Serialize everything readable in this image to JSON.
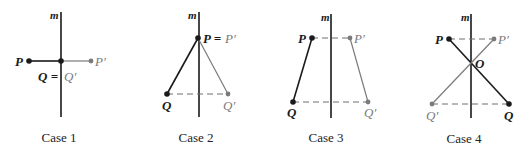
{
  "colors": {
    "original": "#1a1a1a",
    "image": "#7a7a7a",
    "axis": "#1a1a1a",
    "dashed": "#6e6e6e"
  },
  "axis_label": "m",
  "cases": [
    {
      "id": "case-1",
      "caption": "Case 1",
      "caption_pos": [
        59,
        142
      ],
      "axis": {
        "x": 61,
        "y1": 12,
        "y2": 117,
        "label_pos": [
          50,
          19
        ]
      },
      "points": [
        {
          "name": "P",
          "x": 29,
          "y": 61,
          "kind": "original",
          "label": "P",
          "label_pos": [
            15,
            66
          ]
        },
        {
          "name": "Q",
          "x": 61,
          "y": 61,
          "kind": "original",
          "label": "",
          "label_pos": [
            0,
            0
          ]
        },
        {
          "name": "P'",
          "x": 91,
          "y": 61,
          "kind": "image",
          "label": "P′",
          "label_pos": [
            95,
            66
          ]
        }
      ],
      "solid_segments": [
        {
          "from": [
            29,
            61
          ],
          "to": [
            61,
            61
          ],
          "kind": "original"
        },
        {
          "from": [
            61,
            61
          ],
          "to": [
            91,
            61
          ],
          "kind": "image"
        }
      ],
      "dashed_segments": [],
      "extra_labels": [
        {
          "text": "Q =",
          "pos": [
            38,
            81
          ],
          "kind": "original"
        },
        {
          "text": "Q′",
          "pos": [
            64,
            81
          ],
          "kind": "image"
        }
      ]
    },
    {
      "id": "case-2",
      "caption": "Case 2",
      "caption_pos": [
        196,
        142
      ],
      "axis": {
        "x": 199,
        "y1": 12,
        "y2": 117,
        "label_pos": [
          188,
          19
        ]
      },
      "points": [
        {
          "name": "P",
          "x": 198,
          "y": 38,
          "kind": "original",
          "label": "",
          "label_pos": [
            0,
            0
          ]
        },
        {
          "name": "Q",
          "x": 167,
          "y": 94,
          "kind": "original",
          "label": "Q",
          "label_pos": [
            162,
            110
          ]
        },
        {
          "name": "Q'",
          "x": 228,
          "y": 94,
          "kind": "image",
          "label": "Q′",
          "label_pos": [
            223,
            110
          ]
        }
      ],
      "solid_segments": [
        {
          "from": [
            198,
            38
          ],
          "to": [
            167,
            94
          ],
          "kind": "original"
        },
        {
          "from": [
            198,
            38
          ],
          "to": [
            228,
            94
          ],
          "kind": "image"
        }
      ],
      "dashed_segments": [
        {
          "from": [
            167,
            94
          ],
          "to": [
            228,
            94
          ]
        }
      ],
      "extra_labels": [
        {
          "text": "P =",
          "pos": [
            203,
            43
          ],
          "kind": "original"
        },
        {
          "text": "P′",
          "pos": [
            225,
            43
          ],
          "kind": "image"
        }
      ]
    },
    {
      "id": "case-3",
      "caption": "Case 3",
      "caption_pos": [
        326,
        142
      ],
      "axis": {
        "x": 331,
        "y1": 14,
        "y2": 118,
        "label_pos": [
          321,
          21
        ]
      },
      "points": [
        {
          "name": "P",
          "x": 312,
          "y": 38,
          "kind": "original",
          "label": "P",
          "label_pos": [
            298,
            43
          ]
        },
        {
          "name": "P'",
          "x": 350,
          "y": 38,
          "kind": "image",
          "label": "P′",
          "label_pos": [
            354,
            43
          ]
        },
        {
          "name": "Q",
          "x": 293,
          "y": 102,
          "kind": "original",
          "label": "Q",
          "label_pos": [
            287,
            117
          ]
        },
        {
          "name": "Q'",
          "x": 368,
          "y": 102,
          "kind": "image",
          "label": "Q′",
          "label_pos": [
            364,
            117
          ]
        }
      ],
      "solid_segments": [
        {
          "from": [
            312,
            38
          ],
          "to": [
            293,
            102
          ],
          "kind": "original"
        },
        {
          "from": [
            350,
            38
          ],
          "to": [
            368,
            102
          ],
          "kind": "image"
        }
      ],
      "dashed_segments": [
        {
          "from": [
            312,
            38
          ],
          "to": [
            350,
            38
          ]
        },
        {
          "from": [
            293,
            102
          ],
          "to": [
            368,
            102
          ]
        }
      ],
      "extra_labels": []
    },
    {
      "id": "case-4",
      "caption": "Case 4",
      "caption_pos": [
        464,
        143
      ],
      "axis": {
        "x": 471,
        "y1": 14,
        "y2": 118,
        "label_pos": [
          461,
          21
        ]
      },
      "points": [
        {
          "name": "P",
          "x": 449,
          "y": 39,
          "kind": "original",
          "label": "P",
          "label_pos": [
            435,
            44
          ]
        },
        {
          "name": "P'",
          "x": 494,
          "y": 39,
          "kind": "image",
          "label": "P′",
          "label_pos": [
            498,
            44
          ]
        },
        {
          "name": "Q",
          "x": 509,
          "y": 104,
          "kind": "original",
          "label": "Q",
          "label_pos": [
            504,
            120
          ]
        },
        {
          "name": "Q'",
          "x": 432,
          "y": 104,
          "kind": "image",
          "label": "Q′",
          "label_pos": [
            426,
            120
          ]
        }
      ],
      "solid_segments": [
        {
          "from": [
            449,
            39
          ],
          "to": [
            509,
            104
          ],
          "kind": "original"
        },
        {
          "from": [
            494,
            39
          ],
          "to": [
            432,
            104
          ],
          "kind": "image"
        }
      ],
      "dashed_segments": [
        {
          "from": [
            449,
            39
          ],
          "to": [
            494,
            39
          ]
        },
        {
          "from": [
            432,
            104
          ],
          "to": [
            509,
            104
          ]
        }
      ],
      "extra_labels": [
        {
          "text": "O",
          "pos": [
            475,
            68
          ],
          "kind": "original"
        }
      ]
    }
  ]
}
